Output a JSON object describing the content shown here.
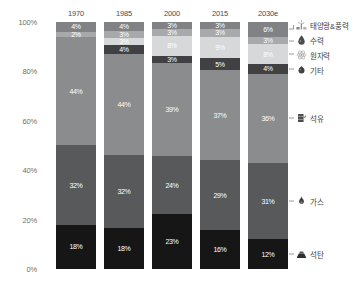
{
  "chart_data": {
    "type": "bar",
    "subtype": "stacked-percentage",
    "title": "",
    "xlabel": "",
    "ylabel": "",
    "ylim": [
      0,
      100
    ],
    "grid": false,
    "legend_position": "right",
    "categories": [
      "1970",
      "1985",
      "2000",
      "2015",
      "2030e"
    ],
    "y_ticks": [
      "0%",
      "20%",
      "40%",
      "60%",
      "80%",
      "100%"
    ],
    "y_tick_values": [
      0,
      20,
      40,
      60,
      80,
      100
    ],
    "series": [
      {
        "name": "태양광&풍력",
        "icon": "solar-wind-icon",
        "color": "#808285",
        "label_color": "#ffffff",
        "values": [
          4,
          4,
          3,
          3,
          6
        ],
        "labels": [
          "4%",
          "4%",
          "3%",
          "3%",
          "6%"
        ]
      },
      {
        "name": "수력",
        "icon": "water-drop-icon",
        "color": "#a7a9ac",
        "label_color": "#ffffff",
        "values": [
          2,
          3,
          3,
          3,
          3
        ],
        "labels": [
          "2%",
          "3%",
          "3%",
          "3%",
          "3%"
        ]
      },
      {
        "name": "원자력",
        "icon": "atom-icon",
        "color": "#d6d8da",
        "label_color": "#ffffff",
        "values": [
          0,
          3,
          8,
          9,
          8
        ],
        "labels": [
          "",
          "3%",
          "8%",
          "9%",
          "8%"
        ]
      },
      {
        "name": "기타",
        "icon": "other-dot-icon",
        "color": "#414042",
        "label_color": "#ffffff",
        "values": [
          0,
          4,
          3,
          5,
          4
        ],
        "labels": [
          "",
          "4%",
          "3%",
          "5%",
          "4%"
        ]
      },
      {
        "name": "석유",
        "icon": "oil-barrel-icon",
        "color": "#8a8c8e",
        "label_color": "#ffffff",
        "values": [
          44,
          44,
          39,
          37,
          36
        ],
        "labels": [
          "44%",
          "44%",
          "39%",
          "37%",
          "36%"
        ]
      },
      {
        "name": "가스",
        "icon": "gas-flame-icon",
        "color": "#58595b",
        "label_color": "#ffffff",
        "values": [
          32,
          32,
          24,
          29,
          31
        ],
        "labels": [
          "32%",
          "32%",
          "24%",
          "29%",
          "31%"
        ]
      },
      {
        "name": "석탄",
        "icon": "coal-icon",
        "color": "#161616",
        "label_color": "#ffffff",
        "values": [
          18,
          18,
          23,
          16,
          12
        ],
        "labels": [
          "18%",
          "18%",
          "23%",
          "16%",
          "12%"
        ]
      }
    ]
  },
  "axis": {
    "ticks": [
      {
        "label": "100%"
      },
      {
        "label": "80%"
      },
      {
        "label": "60%"
      },
      {
        "label": "40%"
      },
      {
        "label": "20%"
      },
      {
        "label": "0%"
      }
    ]
  },
  "columns": [
    {
      "label": "1970"
    },
    {
      "label": "1985"
    },
    {
      "label": "2000"
    },
    {
      "label": "2015"
    },
    {
      "label": "2030e"
    }
  ],
  "legend": {
    "items": [
      {
        "label": "태양광&풍력",
        "icon": "solar-wind-icon"
      },
      {
        "label": "수력",
        "icon": "water-drop-icon"
      },
      {
        "label": "원자력",
        "icon": "atom-icon"
      },
      {
        "label": "기타",
        "icon": "other-dot-icon"
      },
      {
        "label": "석유",
        "icon": "oil-barrel-icon"
      },
      {
        "label": "가스",
        "icon": "gas-flame-icon"
      },
      {
        "label": "석탄",
        "icon": "coal-icon"
      }
    ]
  },
  "colors": {
    "solar_wind": "#808285",
    "hydro": "#a7a9ac",
    "nuclear": "#d6d8da",
    "other": "#414042",
    "oil": "#8a8c8e",
    "gas": "#58595b",
    "coal": "#161616",
    "background": "#ffffff",
    "axis_text": "#6e6e6e",
    "header_text": "#4a4a4a",
    "leader_line": "#9a9a9a"
  }
}
